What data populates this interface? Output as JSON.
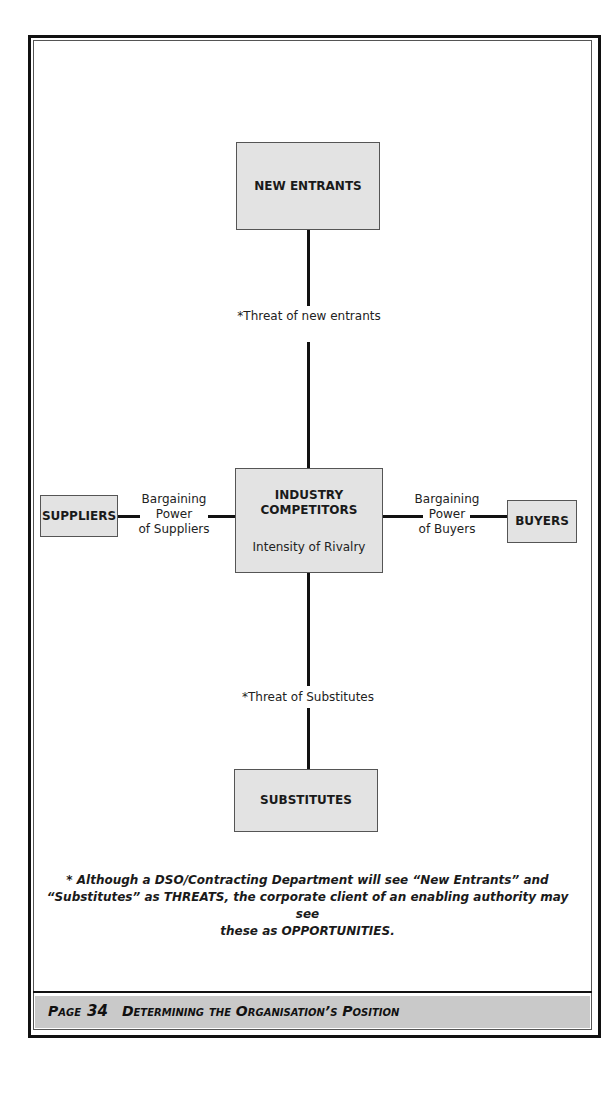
{
  "diagram": {
    "nodes": {
      "new_entrants": {
        "label": "NEW ENTRANTS"
      },
      "industry": {
        "label_line1": "INDUSTRY",
        "label_line2": "COMPETITORS",
        "sublabel": "Intensity of Rivalry"
      },
      "suppliers": {
        "label": "SUPPLIERS"
      },
      "buyers": {
        "label": "BUYERS"
      },
      "substitutes": {
        "label": "SUBSTITUTES"
      }
    },
    "edges": {
      "new_entrants_threat": "*Threat of new entrants",
      "substitutes_threat": "*Threat of Substitutes",
      "suppliers_power": {
        "line1": "Bargaining",
        "line2": "Power",
        "line3": "of Suppliers"
      },
      "buyers_power": {
        "line1": "Bargaining",
        "line2": "Power",
        "line3": "of Buyers"
      }
    }
  },
  "footnote": {
    "line1": "* Although a DSO/Contracting Department will see “New Entrants” and",
    "line2": "“Substitutes” as THREATS, the corporate client of an enabling authority may see",
    "line3": "these as OPPORTUNITIES."
  },
  "footer": {
    "page_word": "Page",
    "page_number": "34",
    "section_title": "Determining the Organisation’s Position"
  }
}
